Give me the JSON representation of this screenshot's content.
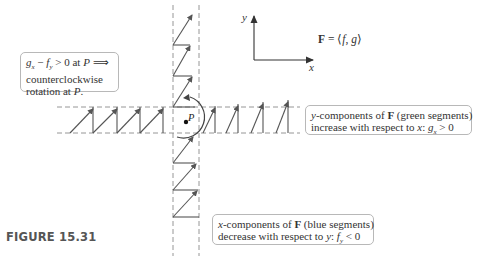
{
  "figure": {
    "label": "FIGURE 15.31"
  },
  "axes": {
    "x_label": "x",
    "y_label": "y"
  },
  "field_equation": {
    "bold": "F",
    "rest_prefix": " = ⟨",
    "f": "f",
    "comma": ", ",
    "g": "g",
    "rest_suffix": "⟩"
  },
  "point": {
    "label": "P"
  },
  "callouts": {
    "curl": {
      "line1_gx": "g",
      "line1_gx_sub": "x",
      "line1_minus": " − ",
      "line1_fy": "f",
      "line1_fy_sub": "y",
      "line1_rest": " > 0 at ",
      "line1_P": "P",
      "line1_arrow": " ⟹",
      "line2": "counterclockwise",
      "line3_prefix": "rotation at ",
      "line3_P": "P",
      "line3_suffix": "."
    },
    "y_components": {
      "line1_y": "y",
      "line1_prefix": "-components of ",
      "line1_F": "F",
      "line1_suffix": " (green segments)",
      "line2_prefix": "increase with respect to ",
      "line2_x": "x",
      "line2_colon": ": ",
      "line2_g": "g",
      "line2_sub": "x",
      "line2_rest": " > 0"
    },
    "x_components": {
      "line1_x": "x",
      "line1_prefix": "-components of ",
      "line1_F": "F",
      "line1_suffix": " (blue segments)",
      "line2_prefix": "decrease with respect to ",
      "line2_y": "y",
      "line2_colon": ": ",
      "line2_f": "f",
      "line2_sub": "y",
      "line2_rest": " < 0"
    }
  },
  "colors": {
    "segment": "#555555",
    "dashed": "#8a8a8a",
    "callout_border": "#b8b8b8",
    "figure_label": "#555555"
  }
}
